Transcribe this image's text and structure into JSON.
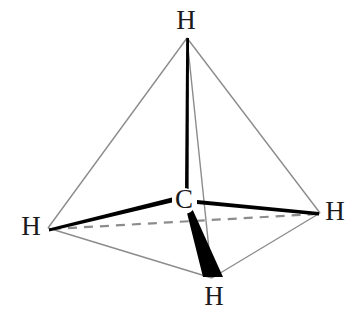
{
  "diagram": {
    "molecule_formula": "CH4",
    "shape": "tetrahedron",
    "background_color": "#ffffff",
    "line_color_outline": "#8c8c8c",
    "line_color_bond": "#000000",
    "label_color": "#1a1a1a",
    "atoms": [
      {
        "id": "atom-c",
        "label": "C",
        "role": "central-carbon",
        "x": 184,
        "y": 201
      },
      {
        "id": "atom-h-top",
        "label": "H",
        "role": "hydrogen-top",
        "x": 186,
        "y": 22
      },
      {
        "id": "atom-h-left",
        "label": "H",
        "role": "hydrogen-left",
        "x": 31,
        "y": 228
      },
      {
        "id": "atom-h-right",
        "label": "H",
        "role": "hydrogen-right",
        "x": 335,
        "y": 213
      },
      {
        "id": "atom-h-front",
        "label": "H",
        "role": "hydrogen-front-wedge",
        "x": 214,
        "y": 298
      }
    ],
    "vertices": {
      "apex": {
        "x": 187,
        "y": 38
      },
      "left": {
        "x": 48,
        "y": 228
      },
      "right": {
        "x": 320,
        "y": 213
      },
      "front": {
        "x": 212,
        "y": 278
      },
      "carbon": {
        "x": 186,
        "y": 197
      }
    },
    "bonds": [
      {
        "id": "bond-c-h-top",
        "from": "C",
        "to": "H-top",
        "style": "plain-bold",
        "depth": "in-plane"
      },
      {
        "id": "bond-c-h-left",
        "from": "C",
        "to": "H-left",
        "style": "plain-bold",
        "depth": "in-plane"
      },
      {
        "id": "bond-c-h-right",
        "from": "C",
        "to": "H-right",
        "style": "plain-bold",
        "depth": "in-plane"
      },
      {
        "id": "bond-c-h-front",
        "from": "C",
        "to": "H-front",
        "style": "solid-wedge",
        "depth": "toward-viewer"
      }
    ],
    "guides": [
      {
        "id": "edge-apex-left",
        "style": "thin-solid"
      },
      {
        "id": "edge-apex-right",
        "style": "thin-solid"
      },
      {
        "id": "edge-apex-front",
        "style": "thin-solid"
      },
      {
        "id": "edge-left-front",
        "style": "thin-solid"
      },
      {
        "id": "edge-right-front",
        "style": "thin-solid"
      },
      {
        "id": "edge-left-right",
        "style": "dashed",
        "depth": "behind"
      }
    ]
  }
}
